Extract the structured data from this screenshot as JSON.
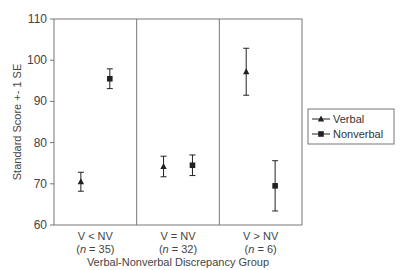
{
  "chart_data": {
    "type": "scatter",
    "title": "",
    "xlabel": "Verbal-Nonverbal Discrepancy Group",
    "ylabel": "Standard Score +- 1 SE",
    "ylim": [
      60,
      110
    ],
    "yticks": [
      60,
      70,
      80,
      90,
      100,
      110
    ],
    "grid": false,
    "legend_position": "right",
    "categories": [
      {
        "label": "V < NV",
        "n_label": "(n = 35)",
        "n": 35
      },
      {
        "label": "V = NV",
        "n_label": "(n = 32)",
        "n": 32
      },
      {
        "label": "V > NV",
        "n_label": "(n = 6)",
        "n": 6
      }
    ],
    "series": [
      {
        "name": "Verbal",
        "marker": "triangle",
        "values": [
          70.5,
          74.2,
          97.2
        ],
        "se": [
          2.3,
          2.5,
          5.7
        ]
      },
      {
        "name": "Nonverbal",
        "marker": "square",
        "values": [
          95.5,
          74.5,
          69.5
        ],
        "se": [
          2.4,
          2.5,
          6.1
        ]
      }
    ]
  },
  "labels": {
    "ylabel": "Standard Score +- 1 SE",
    "xlabel": "Verbal-Nonverbal Discrepancy Group",
    "legend": [
      "Verbal",
      "Nonverbal"
    ]
  },
  "colors": {
    "axis": "#777777",
    "marker": "#222222",
    "text": "#444444"
  }
}
